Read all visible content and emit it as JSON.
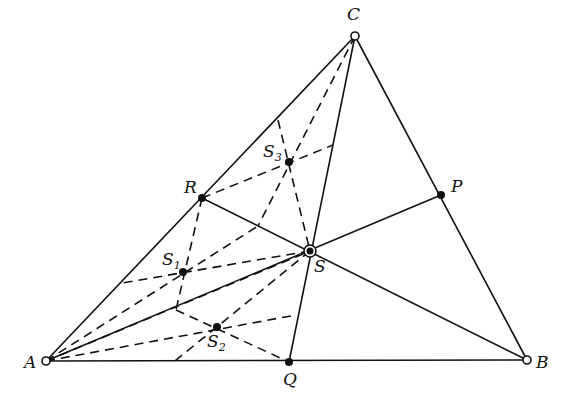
{
  "diagram": {
    "type": "geometry",
    "points": {
      "A": {
        "label": "A",
        "x": 46,
        "y": 361,
        "marker": "open"
      },
      "B": {
        "label": "B",
        "x": 527,
        "y": 360,
        "marker": "open"
      },
      "C": {
        "label": "C",
        "x": 355,
        "y": 36,
        "marker": "open"
      },
      "P": {
        "label": "P",
        "x": 441,
        "y": 195,
        "marker": "filled"
      },
      "Q": {
        "label": "Q",
        "x": 289,
        "y": 362,
        "marker": "filled"
      },
      "R": {
        "label": "R",
        "x": 202,
        "y": 198,
        "marker": "filled"
      },
      "S": {
        "label": "S",
        "x": 310,
        "y": 251,
        "marker": "double"
      },
      "S1": {
        "label": "S",
        "sub": "1",
        "x": 183,
        "y": 272,
        "marker": "filled"
      },
      "S2": {
        "label": "S",
        "sub": "2",
        "x": 217,
        "y": 327,
        "marker": "filled"
      },
      "S3": {
        "label": "S",
        "sub": "3",
        "x": 289,
        "y": 162,
        "marker": "filled"
      }
    },
    "labels": {
      "A": "A",
      "B": "B",
      "C": "C",
      "P": "P",
      "Q": "Q",
      "R": "R",
      "S": "S",
      "S1": "S",
      "S1_sub": "1",
      "S2": "S",
      "S2_sub": "2",
      "S3": "S",
      "S3_sub": "3"
    },
    "colors": {
      "ink": "#111111",
      "background": "#ffffff"
    }
  }
}
